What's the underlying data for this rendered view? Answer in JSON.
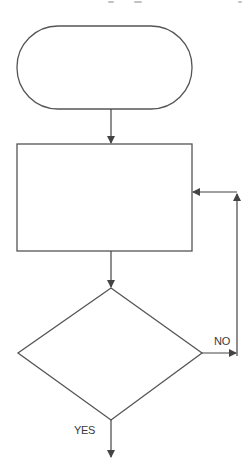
{
  "diagram": {
    "type": "flowchart",
    "colors": {
      "stroke": "#555555",
      "background": "#ffffff",
      "text": "#3a3a3a"
    },
    "nodes": [
      {
        "id": "start",
        "shape": "terminal",
        "text": ""
      },
      {
        "id": "process",
        "shape": "rectangle",
        "text": ""
      },
      {
        "id": "decision",
        "shape": "diamond",
        "text": ""
      }
    ],
    "edges": [
      {
        "from": "start",
        "to": "process",
        "label": ""
      },
      {
        "from": "process",
        "to": "decision",
        "label": ""
      },
      {
        "from": "decision",
        "to": "process",
        "label": "NO"
      },
      {
        "from": "decision",
        "to": "exit",
        "label": "YES"
      }
    ],
    "labels": {
      "no": "NO",
      "yes": "YES"
    }
  }
}
